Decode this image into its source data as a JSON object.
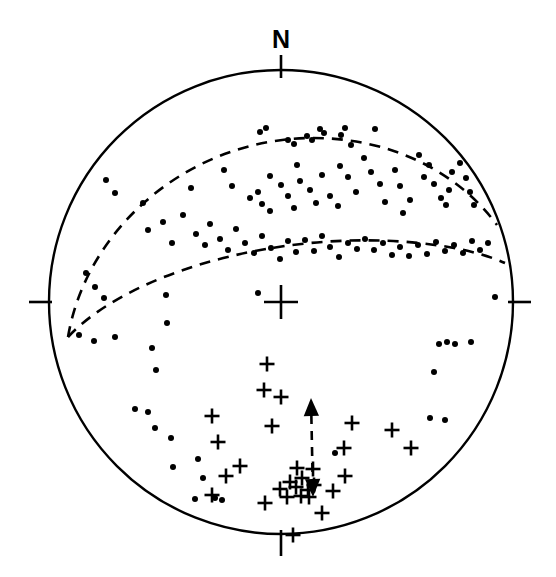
{
  "figure": {
    "type": "stereonet",
    "title": "",
    "projection": "lower-hemisphere equal-area stereographic projection",
    "background_color": "#ffffff",
    "stroke_color": "#000000"
  },
  "primitive_circle": {
    "center_x": 281,
    "center_y": 302,
    "radius": 232,
    "stroke_width": 2.4
  },
  "center_mark": {
    "symbol": "cross",
    "x": 281,
    "y": 302,
    "arm_length": 17,
    "stroke_width": 2.6
  },
  "cardinal_ticks": [
    {
      "name": "north-tick",
      "label": "N",
      "angle_deg": 0,
      "x1": 281,
      "y1": 55,
      "x2": 281,
      "y2": 78,
      "label_x": 281,
      "label_y": 48
    },
    {
      "name": "east-tick",
      "label": "",
      "angle_deg": 90,
      "x1": 508,
      "y1": 302,
      "x2": 531,
      "y2": 302,
      "label_x": 0,
      "label_y": 0
    },
    {
      "name": "south-tick",
      "label": "",
      "angle_deg": 180,
      "x1": 281,
      "y1": 530,
      "x2": 281,
      "y2": 556,
      "label_x": 0,
      "label_y": 0
    },
    {
      "name": "west-tick",
      "label": "",
      "angle_deg": 270,
      "x1": 29,
      "y1": 302,
      "x2": 52,
      "y2": 302,
      "label_x": 0,
      "label_y": 0
    }
  ],
  "great_circles": [
    {
      "name": "upper-dashed-great-circle",
      "style": "dashed",
      "stroke_width": 2.6,
      "dash_pattern": "11 8",
      "path": "M 68 337 C 86 230 186 140 310 138 C 390 137 458 172 497 225"
    },
    {
      "name": "lower-dashed-great-circle",
      "style": "dashed",
      "stroke_width": 2.6,
      "dash_pattern": "11 8",
      "path": "M 68 337 C 110 292 200 254 310 243 C 382 236 460 243 505 263"
    }
  ],
  "vector_arrow": {
    "name": "double-headed-dashed-arrow",
    "style": "dashed",
    "stroke_width": 2.6,
    "dash_pattern": "9 7",
    "x1": 313,
    "y1": 497,
    "x2": 311,
    "y2": 398,
    "head_size": 9,
    "double_headed": true
  },
  "series": [
    {
      "name": "dot-series",
      "symbol": "dot",
      "marker_label": "filled circle",
      "radius": 3.0,
      "color": "#000000",
      "count": 112,
      "points": [
        [
          106,
          180
        ],
        [
          115,
          193
        ],
        [
          143,
          203
        ],
        [
          191,
          188
        ],
        [
          224,
          170
        ],
        [
          270,
          176
        ],
        [
          297,
          165
        ],
        [
          320,
          129
        ],
        [
          324,
          133
        ],
        [
          341,
          135
        ],
        [
          345,
          128
        ],
        [
          351,
          145
        ],
        [
          375,
          129
        ],
        [
          260,
          132
        ],
        [
          266,
          128
        ],
        [
          288,
          140
        ],
        [
          294,
          144
        ],
        [
          307,
          136
        ],
        [
          312,
          140
        ],
        [
          232,
          186
        ],
        [
          250,
          198
        ],
        [
          258,
          192
        ],
        [
          262,
          204
        ],
        [
          270,
          211
        ],
        [
          281,
          185
        ],
        [
          288,
          196
        ],
        [
          294,
          208
        ],
        [
          300,
          181
        ],
        [
          310,
          190
        ],
        [
          316,
          203
        ],
        [
          322,
          175
        ],
        [
          330,
          196
        ],
        [
          340,
          166
        ],
        [
          348,
          177
        ],
        [
          356,
          192
        ],
        [
          338,
          206
        ],
        [
          364,
          158
        ],
        [
          371,
          172
        ],
        [
          380,
          184
        ],
        [
          385,
          202
        ],
        [
          395,
          170
        ],
        [
          400,
          186
        ],
        [
          403,
          213
        ],
        [
          410,
          200
        ],
        [
          419,
          155
        ],
        [
          424,
          177
        ],
        [
          429,
          165
        ],
        [
          434,
          184
        ],
        [
          441,
          198
        ],
        [
          446,
          205
        ],
        [
          449,
          190
        ],
        [
          452,
          172
        ],
        [
          460,
          163
        ],
        [
          466,
          178
        ],
        [
          470,
          192
        ],
        [
          474,
          205
        ],
        [
          148,
          230
        ],
        [
          163,
          222
        ],
        [
          172,
          243
        ],
        [
          183,
          215
        ],
        [
          196,
          234
        ],
        [
          205,
          245
        ],
        [
          210,
          224
        ],
        [
          220,
          239
        ],
        [
          228,
          250
        ],
        [
          236,
          229
        ],
        [
          245,
          243
        ],
        [
          254,
          253
        ],
        [
          262,
          236
        ],
        [
          271,
          248
        ],
        [
          280,
          259
        ],
        [
          288,
          241
        ],
        [
          296,
          252
        ],
        [
          305,
          240
        ],
        [
          314,
          251
        ],
        [
          322,
          236
        ],
        [
          330,
          247
        ],
        [
          339,
          257
        ],
        [
          348,
          243
        ],
        [
          357,
          249
        ],
        [
          365,
          239
        ],
        [
          374,
          250
        ],
        [
          383,
          243
        ],
        [
          392,
          255
        ],
        [
          400,
          247
        ],
        [
          409,
          256
        ],
        [
          418,
          245
        ],
        [
          427,
          254
        ],
        [
          436,
          242
        ],
        [
          445,
          251
        ],
        [
          454,
          245
        ],
        [
          463,
          253
        ],
        [
          472,
          241
        ],
        [
          480,
          250
        ],
        [
          488,
          243
        ],
        [
          86,
          273
        ],
        [
          95,
          287
        ],
        [
          104,
          298
        ],
        [
          79,
          335
        ],
        [
          94,
          341
        ],
        [
          115,
          337
        ],
        [
          166,
          295
        ],
        [
          167,
          323
        ],
        [
          258,
          293
        ],
        [
          156,
          370
        ],
        [
          135,
          409
        ],
        [
          148,
          412
        ],
        [
          155,
          428
        ],
        [
          171,
          438
        ],
        [
          173,
          467
        ],
        [
          203,
          478
        ],
        [
          195,
          499
        ],
        [
          215,
          498
        ],
        [
          222,
          500
        ],
        [
          439,
          344
        ],
        [
          455,
          344
        ],
        [
          447,
          342
        ],
        [
          434,
          372
        ],
        [
          445,
          420
        ],
        [
          471,
          342
        ],
        [
          495,
          297
        ],
        [
          430,
          418
        ],
        [
          335,
          453
        ],
        [
          152,
          348
        ],
        [
          198,
          459
        ]
      ]
    },
    {
      "name": "plus-series",
      "symbol": "plus",
      "marker_label": "plus cross",
      "size": 7.5,
      "stroke_width": 2.6,
      "color": "#000000",
      "count": 29,
      "points": [
        [
          267,
          364
        ],
        [
          264,
          390
        ],
        [
          281,
          397
        ],
        [
          212,
          416
        ],
        [
          272,
          426
        ],
        [
          352,
          423
        ],
        [
          392,
          430
        ],
        [
          411,
          448
        ],
        [
          344,
          448
        ],
        [
          345,
          476
        ],
        [
          314,
          485
        ],
        [
          296,
          487
        ],
        [
          290,
          482
        ],
        [
          302,
          478
        ],
        [
          280,
          489
        ],
        [
          308,
          490
        ],
        [
          333,
          491
        ],
        [
          226,
          476
        ],
        [
          212,
          495
        ],
        [
          265,
          503
        ],
        [
          322,
          513
        ],
        [
          293,
          535
        ],
        [
          309,
          497
        ],
        [
          287,
          497
        ],
        [
          301,
          496
        ],
        [
          297,
          468
        ],
        [
          313,
          469
        ],
        [
          240,
          466
        ],
        [
          218,
          442
        ]
      ]
    }
  ],
  "legend": {
    "visible": false,
    "entries": []
  },
  "chart_data": {
    "type": "scatter",
    "title": "",
    "xlabel": "",
    "ylabel": "",
    "axis_labels": [
      "N"
    ],
    "grid": false,
    "legend_position": "none"
  }
}
